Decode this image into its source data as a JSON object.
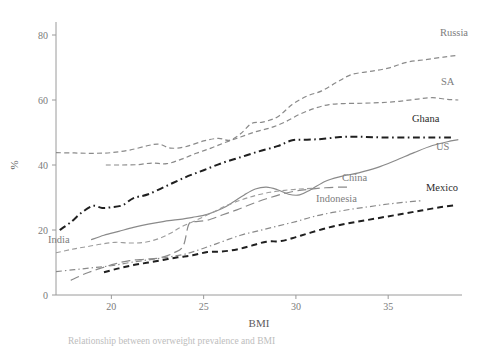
{
  "chart_data": {
    "type": "line",
    "title": "",
    "xlabel": "BMI",
    "ylabel": "%",
    "xlim": [
      17,
      39
    ],
    "ylim": [
      0,
      84
    ],
    "xticks": [
      20,
      25,
      30,
      35
    ],
    "yticks": [
      0,
      20,
      40,
      60,
      80
    ],
    "grid": false,
    "legend_position": "end-of-line labels at right",
    "series": [
      {
        "name": "Russia",
        "label": "Russia",
        "color": "#8a8a8a",
        "style": "dashed",
        "width": 1.2,
        "label_x": 440,
        "label_y": 36,
        "x": [
          17.0,
          18.0,
          19.0,
          20.0,
          21.0,
          22.0,
          22.6,
          23.2,
          24.0,
          25.0,
          25.8,
          26.4,
          27.0,
          27.6,
          28.2,
          29.0,
          29.8,
          30.6,
          31.4,
          32.2,
          33.0,
          34.0,
          35.0,
          36.0,
          37.0,
          38.0,
          38.8
        ],
        "y": [
          43.8,
          43.7,
          43.6,
          43.8,
          44.6,
          46.0,
          46.4,
          45.2,
          45.6,
          47.4,
          48.2,
          47.6,
          49.6,
          52.8,
          53.2,
          54.8,
          58.6,
          61.2,
          62.8,
          65.4,
          67.8,
          68.8,
          69.8,
          71.6,
          72.4,
          73.2,
          73.8
        ]
      },
      {
        "name": "SA",
        "label": "SA",
        "color": "#8a8a8a",
        "style": "dashed",
        "width": 1.2,
        "label_x": 441,
        "label_y": 85,
        "x": [
          19.7,
          20.5,
          21.4,
          22.2,
          23.0,
          23.8,
          24.6,
          25.4,
          26.2,
          27.0,
          27.8,
          28.6,
          29.4,
          30.2,
          31.0,
          31.8,
          32.6,
          33.6,
          34.6,
          35.6,
          36.6,
          37.4,
          38.2,
          38.8
        ],
        "y": [
          40.0,
          40.0,
          40.1,
          40.6,
          40.4,
          41.8,
          43.6,
          45.2,
          47.0,
          48.6,
          50.2,
          51.4,
          53.2,
          55.6,
          57.4,
          58.6,
          58.9,
          59.0,
          59.2,
          59.6,
          60.3,
          60.7,
          60.2,
          60.0
        ]
      },
      {
        "name": "Ghana",
        "label": "Ghana",
        "color": "#1f1f1f",
        "style": "dashdot",
        "width": 2.0,
        "label_x": 412,
        "label_y": 122,
        "x": [
          17.2,
          17.8,
          18.4,
          19.0,
          19.5,
          20.0,
          20.6,
          21.2,
          22.0,
          23.0,
          24.0,
          25.0,
          26.0,
          27.0,
          28.0,
          29.0,
          29.8,
          30.6,
          31.4,
          32.4,
          33.4,
          34.6,
          36.0,
          37.2,
          38.4
        ],
        "y": [
          20.0,
          22.4,
          25.4,
          27.4,
          26.8,
          27.0,
          27.6,
          29.8,
          31.0,
          33.6,
          36.2,
          38.4,
          40.6,
          42.4,
          44.2,
          45.8,
          47.6,
          47.8,
          48.0,
          48.6,
          48.7,
          48.5,
          48.5,
          48.5,
          48.5
        ]
      },
      {
        "name": "US",
        "label": "US",
        "color": "#8a8a8a",
        "style": "solid",
        "width": 1.2,
        "label_x": 436,
        "label_y": 150,
        "x": [
          18.9,
          19.6,
          20.4,
          21.2,
          22.0,
          22.8,
          23.6,
          24.4,
          25.2,
          26.0,
          26.6,
          27.2,
          27.8,
          28.4,
          29.0,
          29.6,
          30.2,
          30.8,
          31.6,
          32.4,
          33.4,
          34.4,
          35.4,
          36.4,
          37.4,
          38.4,
          38.8
        ],
        "y": [
          17.0,
          18.4,
          19.6,
          20.8,
          21.8,
          22.6,
          23.2,
          23.9,
          24.8,
          26.6,
          28.6,
          30.8,
          32.6,
          33.2,
          32.4,
          31.0,
          30.8,
          32.4,
          35.0,
          36.4,
          37.6,
          39.2,
          41.4,
          43.8,
          46.0,
          47.4,
          47.8
        ]
      },
      {
        "name": "China",
        "label": "China",
        "color": "#8a8a8a",
        "style": "longdash",
        "width": 1.2,
        "label_x": 342,
        "label_y": 181,
        "x": [
          17.8,
          18.6,
          19.4,
          20.2,
          21.0,
          21.8,
          22.6,
          23.4,
          23.9,
          24.2,
          24.6,
          25.2,
          26.0,
          26.8,
          27.6,
          28.4,
          29.2,
          30.0,
          30.8,
          31.6,
          32.4,
          32.9
        ],
        "y": [
          4.5,
          6.6,
          8.2,
          9.6,
          10.6,
          11.0,
          11.4,
          13.0,
          15.2,
          21.8,
          22.6,
          23.0,
          24.6,
          26.2,
          28.0,
          29.6,
          31.0,
          32.0,
          32.6,
          33.0,
          33.2,
          33.2
        ]
      },
      {
        "name": "India",
        "label": "India",
        "color": "#9c9c9c",
        "style": "dashed",
        "width": 1.1,
        "label_x": 48,
        "label_y": 243,
        "x": [
          17.0,
          17.8,
          18.6,
          19.4,
          20.2,
          21.0,
          21.8,
          22.6,
          23.2,
          23.8,
          24.6,
          25.4,
          26.2,
          27.0,
          27.8,
          28.6,
          29.4,
          30.2,
          30.9
        ],
        "y": [
          13.0,
          14.0,
          14.8,
          15.6,
          16.2,
          16.0,
          16.2,
          17.4,
          19.0,
          21.0,
          23.0,
          25.2,
          27.4,
          29.2,
          30.6,
          31.6,
          32.2,
          32.6,
          32.8
        ]
      },
      {
        "name": "Indonesia",
        "label": "Indonesia",
        "color": "#8a8a8a",
        "style": "dashdot",
        "width": 1.2,
        "label_x": 316,
        "label_y": 202,
        "x": [
          17.0,
          18.0,
          19.0,
          20.0,
          21.0,
          22.0,
          23.0,
          24.0,
          25.0,
          26.0,
          27.0,
          28.0,
          29.0,
          30.0,
          31.0,
          32.0,
          33.0,
          34.0,
          35.0,
          36.0,
          36.8
        ],
        "y": [
          7.2,
          7.8,
          8.4,
          9.0,
          10.0,
          10.8,
          11.6,
          12.6,
          14.4,
          16.4,
          18.4,
          19.8,
          21.2,
          22.6,
          24.2,
          25.4,
          26.4,
          27.2,
          28.0,
          28.6,
          29.0
        ]
      },
      {
        "name": "Mexico",
        "label": "Mexico",
        "color": "#1f1f1f",
        "style": "dashed",
        "width": 2.0,
        "label_x": 426,
        "label_y": 191,
        "x": [
          19.6,
          20.4,
          21.2,
          22.0,
          22.8,
          23.6,
          24.4,
          25.2,
          26.0,
          26.8,
          27.6,
          28.4,
          29.2,
          30.0,
          30.8,
          31.8,
          32.8,
          33.8,
          34.8,
          35.8,
          36.8,
          37.8,
          38.6
        ],
        "y": [
          7.0,
          8.2,
          9.2,
          10.0,
          10.8,
          11.6,
          12.2,
          13.2,
          13.4,
          14.0,
          15.2,
          16.4,
          16.6,
          17.8,
          19.2,
          20.8,
          22.0,
          23.0,
          24.0,
          25.0,
          26.0,
          27.0,
          27.6
        ]
      }
    ]
  },
  "axes": {
    "y_title": "%",
    "x_title": "BMI",
    "x_tick_labels": [
      "20",
      "25",
      "30",
      "35"
    ],
    "y_tick_labels": [
      "0",
      "20",
      "40",
      "60",
      "80"
    ]
  },
  "caption": {
    "text": "Relationship between overweight prevalence and BMI"
  }
}
